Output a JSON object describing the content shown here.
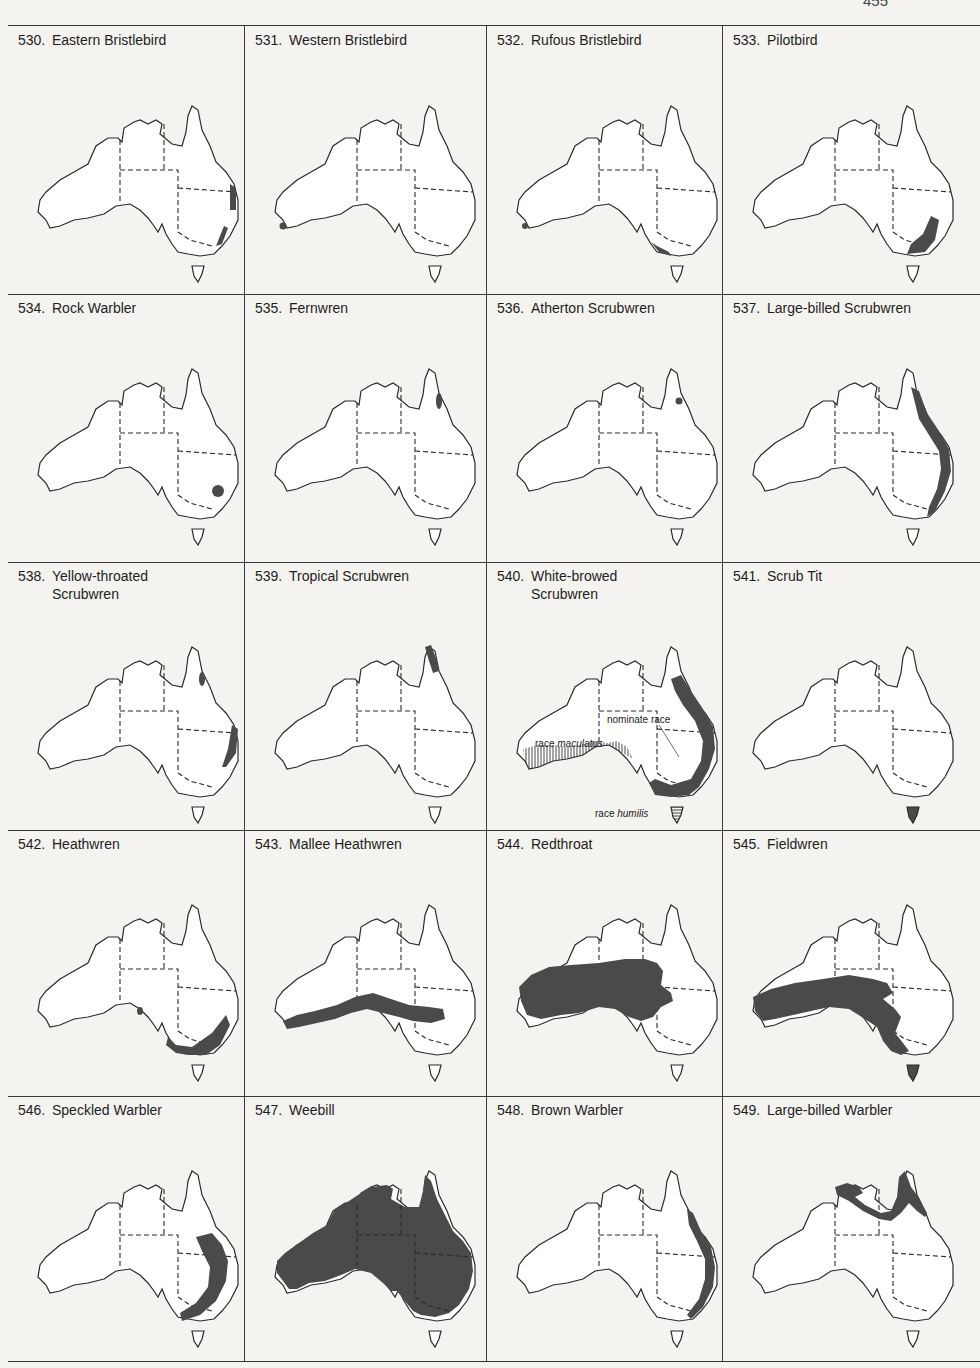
{
  "page": {
    "page_number": "455",
    "fill_color": "#4a4a4a",
    "outline_color": "#2a2a2a"
  },
  "rows": [
    {
      "cells": [
        {
          "number": "530.",
          "name": "Eastern Bristlebird",
          "range": "east-coast-patches"
        },
        {
          "number": "531.",
          "name": "Western Bristlebird",
          "range": "sw-dot"
        },
        {
          "number": "532.",
          "name": "Rufous Bristlebird",
          "range": "sw-dot-plus-vic-coast"
        },
        {
          "number": "533.",
          "name": "Pilotbird",
          "range": "se-highlands"
        }
      ]
    },
    {
      "cells": [
        {
          "number": "534.",
          "name": "Rock Warbler",
          "range": "sydney-region"
        },
        {
          "number": "535.",
          "name": "Fernwren",
          "range": "ne-qld-small"
        },
        {
          "number": "536.",
          "name": "Atherton Scrubwren",
          "range": "ne-qld-dot"
        },
        {
          "number": "537.",
          "name": "Large-billed Scrubwren",
          "range": "east-coast-strip"
        }
      ]
    },
    {
      "cells": [
        {
          "number": "538.",
          "name": "Yellow-throated\nScrubwren",
          "range": "ne-qld-plus-nsw-coast"
        },
        {
          "number": "539.",
          "name": "Tropical Scrubwren",
          "range": "cape-york-tip"
        },
        {
          "number": "540.",
          "name": "White-browed\nScrubwren",
          "range": "white-browed",
          "annotations": {
            "nominate": "nominate race",
            "maculatus_prefix": "race ",
            "maculatus": "maculatus",
            "humilis_prefix": "race ",
            "humilis": "humilis"
          }
        },
        {
          "number": "541.",
          "name": "Scrub Tit",
          "range": "tasmania"
        }
      ]
    },
    {
      "cells": [
        {
          "number": "542.",
          "name": "Heathwren",
          "range": "se-south"
        },
        {
          "number": "543.",
          "name": "Mallee Heathwren",
          "range": "southern-band"
        },
        {
          "number": "544.",
          "name": "Redthroat",
          "range": "central-south-wide"
        },
        {
          "number": "545.",
          "name": "Fieldwren",
          "range": "south-wide-plus-tas"
        }
      ]
    },
    {
      "cells": [
        {
          "number": "546.",
          "name": "Speckled Warbler",
          "range": "east-inland-arc"
        },
        {
          "number": "547.",
          "name": "Weebill",
          "range": "almost-all"
        },
        {
          "number": "548.",
          "name": "Brown Warbler",
          "range": "east-coast-long"
        },
        {
          "number": "549.",
          "name": "Large-billed Warbler",
          "range": "north-coast"
        }
      ]
    }
  ]
}
